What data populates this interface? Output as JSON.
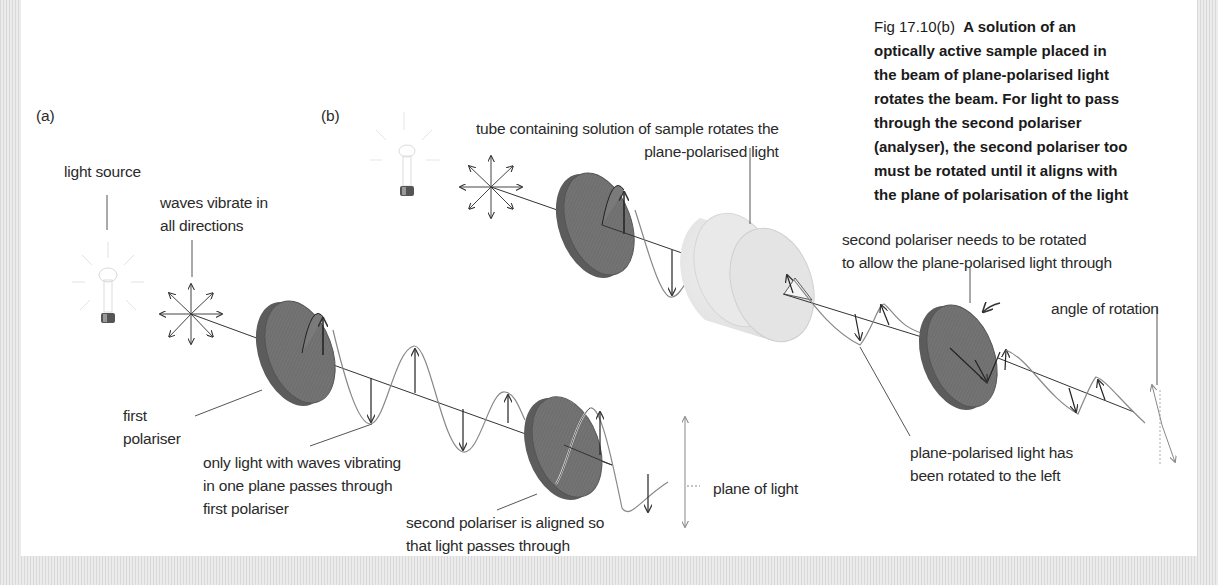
{
  "figure": {
    "number": "Fig 17.10(b)",
    "caption_lines": [
      "A solution of an",
      "optically active sample placed in",
      "the beam of plane-polarised light",
      "rotates the beam. For light to pass",
      "through the second polariser",
      "(analyser), the second polariser too",
      "must be rotated until it aligns with",
      "the plane of polarisation of the light"
    ]
  },
  "panel_a": {
    "label": "(a)",
    "light_source": "light source",
    "waves_vibrate": [
      "waves vibrate in",
      "all directions"
    ],
    "first_polariser": [
      "first",
      "polariser"
    ],
    "only_light": [
      "only light with waves vibrating",
      "in one plane passes through",
      "first polariser"
    ],
    "second_polariser": [
      "second polariser is aligned so",
      "that light passes through"
    ],
    "plane_of_light": "plane of light"
  },
  "panel_b": {
    "label": "(b)",
    "tube": [
      "tube containing solution of sample rotates the",
      "plane-polarised light"
    ],
    "second_polariser": [
      "second polariser needs to be rotated",
      "to allow the plane-polarised light through"
    ],
    "angle_of_rotation": "angle of rotation",
    "rotated_left": [
      "plane-polarised light has",
      "been rotated to the left"
    ]
  },
  "colors": {
    "polariser_fill": "#6e6e6e",
    "polariser_edge": "#555555",
    "tube_fill": "#e8e8e8",
    "line": "#333333",
    "wave": "#777777",
    "leader": "#555555",
    "frame": "#e3e3e3"
  }
}
